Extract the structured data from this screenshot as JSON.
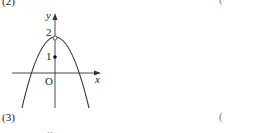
{
  "problems": [
    {
      "number": "(2)",
      "answer_paren": "("
    },
    {
      "number": "(3)",
      "answer_paren": "("
    }
  ],
  "graph": {
    "y_axis_label": "y",
    "x_axis_label": "x",
    "origin_label": "O",
    "tick_2": "2",
    "tick_1": "1",
    "curve": "downward parabola, vertex at (0,2) shown as open circle",
    "point_filled": "(0,1)",
    "point_open": "(0,2)"
  },
  "next_graph": {
    "y_axis_label": "y"
  },
  "colors": {
    "ink": "#222222",
    "background": "#ffffff"
  }
}
